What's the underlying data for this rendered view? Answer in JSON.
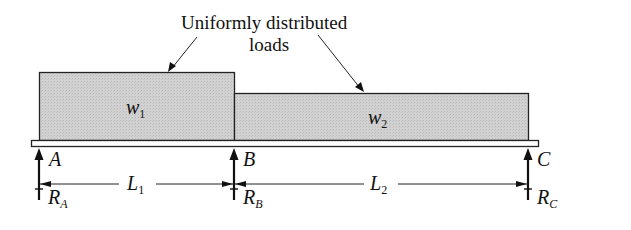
{
  "diagram": {
    "annotation": {
      "line1": "Uniformly distributed",
      "line2": "loads"
    },
    "loads": [
      {
        "symbol": "w",
        "subscript": "1",
        "x_start": 39,
        "x_end": 234,
        "height_px": 68
      },
      {
        "symbol": "w",
        "subscript": "2",
        "x_start": 234,
        "x_end": 528,
        "height_px": 47
      }
    ],
    "supports": [
      {
        "point": "A",
        "reaction": "R",
        "reaction_sub": "A"
      },
      {
        "point": "B",
        "reaction": "R",
        "reaction_sub": "B"
      },
      {
        "point": "C",
        "reaction": "R",
        "reaction_sub": "C"
      }
    ],
    "spans": [
      {
        "symbol": "L",
        "subscript": "1",
        "from": "A",
        "to": "B"
      },
      {
        "symbol": "L",
        "subscript": "2",
        "from": "B",
        "to": "C"
      }
    ],
    "colors": {
      "load_fill": "#cfcfcf",
      "stroke": "#222222",
      "beam_fill": "#ffffff"
    }
  }
}
